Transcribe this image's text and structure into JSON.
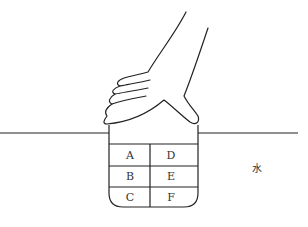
{
  "diagram": {
    "cells": [
      {
        "label": "A"
      },
      {
        "label": "D"
      },
      {
        "label": "B"
      },
      {
        "label": "E"
      },
      {
        "label": "C"
      },
      {
        "label": "F"
      }
    ],
    "water_label": "水",
    "line_color": "#222222"
  }
}
